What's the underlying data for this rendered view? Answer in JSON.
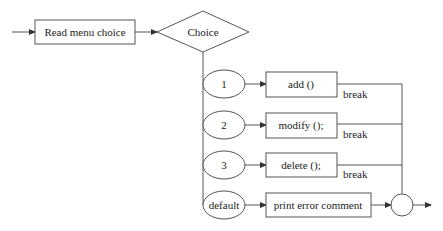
{
  "diagram": {
    "type": "flowchart",
    "start": {
      "label": "Read menu choice"
    },
    "decision": {
      "label": "Choice"
    },
    "cases": [
      {
        "case_label": "1",
        "action": "add ()",
        "exit": "break"
      },
      {
        "case_label": "2",
        "action": "modify ();",
        "exit": "break"
      },
      {
        "case_label": "3",
        "action": "delete ();",
        "exit": "break"
      },
      {
        "case_label": "default",
        "action": "print error comment",
        "exit": ""
      }
    ],
    "merge": {
      "label": ""
    },
    "colors": {
      "stroke": "#555555",
      "fill": "#ffffff",
      "text": "#222222"
    }
  }
}
